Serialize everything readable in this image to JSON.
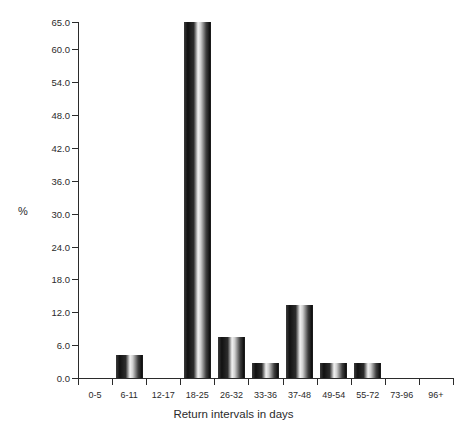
{
  "chart_data": {
    "type": "bar",
    "title": "",
    "xlabel": "Return intervals in days",
    "ylabel": "%",
    "categories": [
      "0-5",
      "6-11",
      "12-17",
      "18-25",
      "26-32",
      "33-36",
      "37-48",
      "49-54",
      "55-72",
      "73-96",
      "96+"
    ],
    "values": [
      0.0,
      4.2,
      0.0,
      65.0,
      7.5,
      2.8,
      13.3,
      2.8,
      2.8,
      0.0,
      0.0
    ],
    "ylim": [
      0.0,
      65.0
    ],
    "ytick_labels": [
      "0.0",
      "6.0",
      "12.0",
      "18.0",
      "24.0",
      "30.0",
      "36.0",
      "42.0",
      "48.0",
      "54.0",
      "60.0",
      "65.0"
    ],
    "ytick_values": [
      0.0,
      6.0,
      12.0,
      18.0,
      24.0,
      30.0,
      36.0,
      42.0,
      48.0,
      54.0,
      60.0,
      65.0
    ],
    "grid": false,
    "legend": null,
    "legend_position": "none",
    "bar_style": "cylindrical-gradient",
    "bar_color": "#111111"
  }
}
